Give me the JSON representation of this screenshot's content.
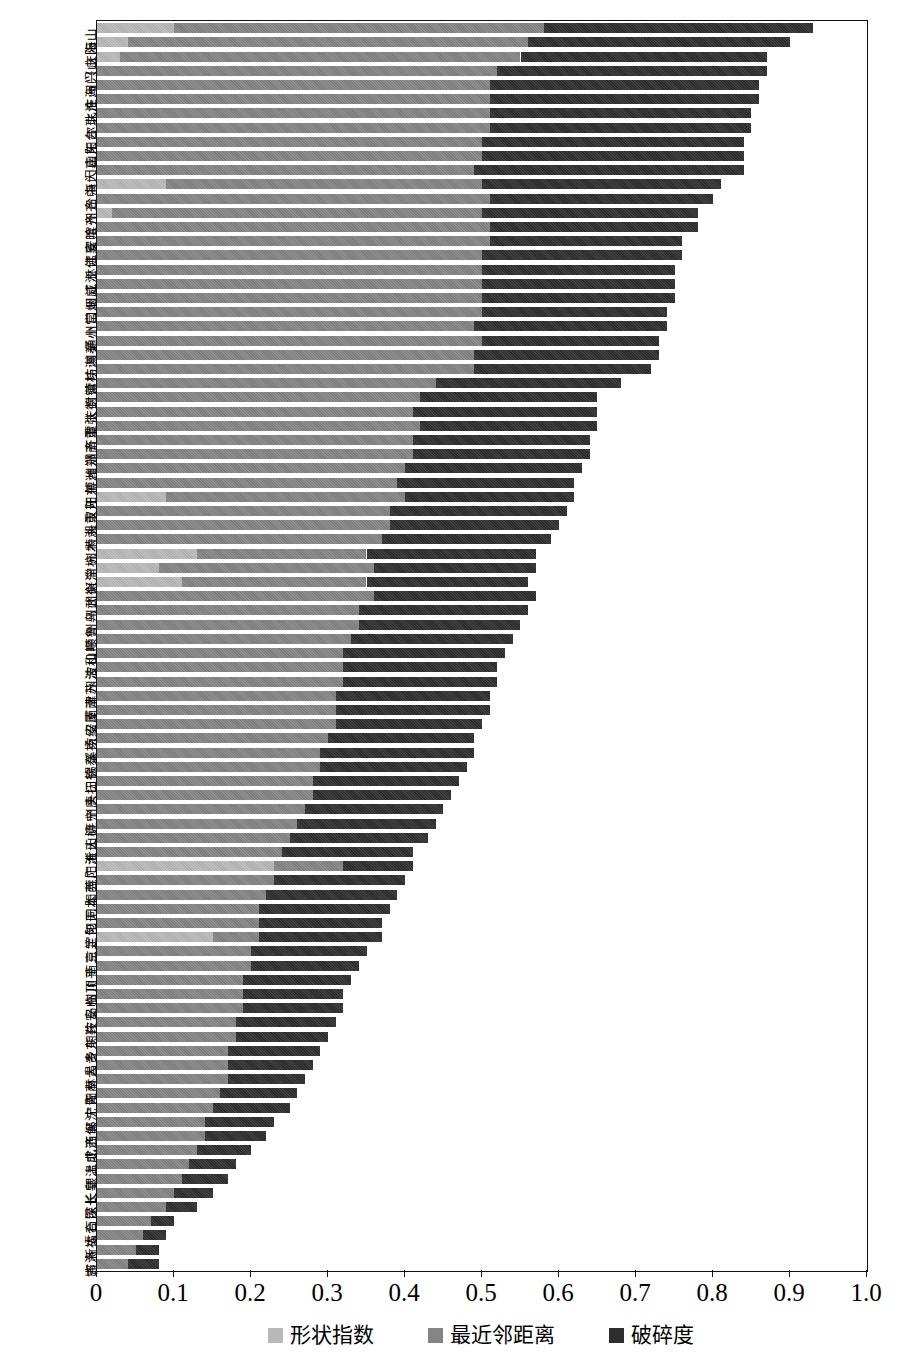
{
  "chart_data": {
    "type": "bar",
    "orientation": "horizontal",
    "stacked": true,
    "title": "",
    "xlabel": "",
    "ylabel": "",
    "xlim": [
      0,
      1.0
    ],
    "xticks": [
      "0",
      "0.1",
      "0.2",
      "0.3",
      "0.4",
      "0.5",
      "0.6",
      "0.7",
      "0.8",
      "0.9",
      "1.0"
    ],
    "grid": false,
    "legend_position": "bottom-center",
    "series": [
      {
        "name": "形状指数",
        "color": "#b9b9b9"
      },
      {
        "name": "最近邻距离",
        "color": "#848484"
      },
      {
        "name": "破碎度",
        "color": "#2e2e2e"
      }
    ],
    "categories": [
      "海山",
      "庆阳",
      "兴山",
      "州门",
      "庄海",
      "北淮",
      "尔珠",
      "阳台",
      "山东",
      "门嘉",
      "海大",
      "台中",
      "州齐",
      "滨齐",
      "安哈",
      "江襄",
      "林佛",
      "江江",
      "州威",
      "口烟",
      "州常",
      "通小",
      "州秦",
      "坊淇",
      "营桂",
      "封镇",
      "庆德",
      "潭张",
      "齐重",
      "洲南",
      "州郑",
      "博潍",
      "阳东",
      "汉开",
      "头重",
      "特湘",
      "州木",
      "宁杭",
      "兴淄",
      "州衡",
      "州武",
      "州乌",
      "顺鲁",
      "山呼",
      "波和",
      "州浩",
      "津苏",
      "南南",
      "安厦",
      "京绍",
      "溪扬",
      "锡泰",
      "口徐",
      "头抚",
      "州唐",
      "连宁",
      "山柳",
      "沂天",
      "阳淮",
      "莞广",
      "阳西",
      "同本",
      "阳无",
      "定包",
      "京兰",
      "南三",
      "川平",
      "州顶",
      "岛临",
      "庄安",
      "明鞍",
      "乡东",
      "昌贵",
      "林大",
      "阳南",
      "宁青",
      "郸沈",
      "西保",
      "北济",
      "上成",
      "银温",
      "长皇",
      "深长",
      "石昆",
      "太合",
      "新福",
      "吉洛",
      "邯"
    ],
    "bars": [
      {
        "label": "海山",
        "shape": 0.1,
        "nnd": 0.48,
        "frag": 0.35
      },
      {
        "label": "庆阳",
        "shape": 0.04,
        "nnd": 0.52,
        "frag": 0.34
      },
      {
        "label": "兴山",
        "shape": 0.03,
        "nnd": 0.52,
        "frag": 0.32
      },
      {
        "label": "州门",
        "shape": 0.0,
        "nnd": 0.52,
        "frag": 0.35
      },
      {
        "label": "庄海",
        "shape": 0.0,
        "nnd": 0.51,
        "frag": 0.35
      },
      {
        "label": "北淮",
        "shape": 0.0,
        "nnd": 0.51,
        "frag": 0.35
      },
      {
        "label": "尔珠",
        "shape": 0.0,
        "nnd": 0.51,
        "frag": 0.34
      },
      {
        "label": "阳台",
        "shape": 0.0,
        "nnd": 0.51,
        "frag": 0.34
      },
      {
        "label": "山东",
        "shape": 0.0,
        "nnd": 0.5,
        "frag": 0.34
      },
      {
        "label": "门嘉",
        "shape": 0.0,
        "nnd": 0.5,
        "frag": 0.34
      },
      {
        "label": "海大",
        "shape": 0.0,
        "nnd": 0.49,
        "frag": 0.35
      },
      {
        "label": "台中",
        "shape": 0.09,
        "nnd": 0.41,
        "frag": 0.31
      },
      {
        "label": "州齐",
        "shape": 0.0,
        "nnd": 0.51,
        "frag": 0.29
      },
      {
        "label": "滨齐",
        "shape": 0.02,
        "nnd": 0.48,
        "frag": 0.28
      },
      {
        "label": "安哈",
        "shape": 0.0,
        "nnd": 0.51,
        "frag": 0.27
      },
      {
        "label": "江襄",
        "shape": 0.0,
        "nnd": 0.51,
        "frag": 0.25
      },
      {
        "label": "林佛",
        "shape": 0.0,
        "nnd": 0.5,
        "frag": 0.26
      },
      {
        "label": "江江",
        "shape": 0.0,
        "nnd": 0.5,
        "frag": 0.25
      },
      {
        "label": "州威",
        "shape": 0.0,
        "nnd": 0.5,
        "frag": 0.25
      },
      {
        "label": "口烟",
        "shape": 0.0,
        "nnd": 0.5,
        "frag": 0.25
      },
      {
        "label": "州常",
        "shape": 0.0,
        "nnd": 0.5,
        "frag": 0.24
      },
      {
        "label": "通小",
        "shape": 0.0,
        "nnd": 0.49,
        "frag": 0.25
      },
      {
        "label": "州秦",
        "shape": 0.0,
        "nnd": 0.5,
        "frag": 0.23
      },
      {
        "label": "坊淇",
        "shape": 0.0,
        "nnd": 0.49,
        "frag": 0.24
      },
      {
        "label": "营桂",
        "shape": 0.0,
        "nnd": 0.49,
        "frag": 0.23
      },
      {
        "label": "封镇",
        "shape": 0.0,
        "nnd": 0.44,
        "frag": 0.24
      },
      {
        "label": "庆德",
        "shape": 0.0,
        "nnd": 0.42,
        "frag": 0.23
      },
      {
        "label": "潭张",
        "shape": 0.0,
        "nnd": 0.41,
        "frag": 0.24
      },
      {
        "label": "齐重",
        "shape": 0.0,
        "nnd": 0.42,
        "frag": 0.23
      },
      {
        "label": "洲南",
        "shape": 0.0,
        "nnd": 0.41,
        "frag": 0.23
      },
      {
        "label": "州郑",
        "shape": 0.0,
        "nnd": 0.41,
        "frag": 0.23
      },
      {
        "label": "博潍",
        "shape": 0.0,
        "nnd": 0.4,
        "frag": 0.23
      },
      {
        "label": "阳东",
        "shape": 0.0,
        "nnd": 0.39,
        "frag": 0.23
      },
      {
        "label": "汉开",
        "shape": 0.09,
        "nnd": 0.31,
        "frag": 0.22
      },
      {
        "label": "头重",
        "shape": 0.0,
        "nnd": 0.38,
        "frag": 0.23
      },
      {
        "label": "特湘",
        "shape": 0.0,
        "nnd": 0.38,
        "frag": 0.22
      },
      {
        "label": "州木",
        "shape": 0.0,
        "nnd": 0.37,
        "frag": 0.22
      },
      {
        "label": "宁杭",
        "shape": 0.13,
        "nnd": 0.22,
        "frag": 0.22
      },
      {
        "label": "兴淄",
        "shape": 0.08,
        "nnd": 0.28,
        "frag": 0.21
      },
      {
        "label": "州衡",
        "shape": 0.11,
        "nnd": 0.24,
        "frag": 0.21
      },
      {
        "label": "州武",
        "shape": 0.0,
        "nnd": 0.36,
        "frag": 0.21
      },
      {
        "label": "州乌",
        "shape": 0.0,
        "nnd": 0.34,
        "frag": 0.22
      },
      {
        "label": "顺鲁",
        "shape": 0.0,
        "nnd": 0.34,
        "frag": 0.21
      },
      {
        "label": "山呼",
        "shape": 0.0,
        "nnd": 0.33,
        "frag": 0.21
      },
      {
        "label": "波和",
        "shape": 0.0,
        "nnd": 0.32,
        "frag": 0.21
      },
      {
        "label": "州浩",
        "shape": 0.0,
        "nnd": 0.32,
        "frag": 0.2
      },
      {
        "label": "津苏",
        "shape": 0.0,
        "nnd": 0.32,
        "frag": 0.2
      },
      {
        "label": "南南",
        "shape": 0.0,
        "nnd": 0.31,
        "frag": 0.2
      },
      {
        "label": "安厦",
        "shape": 0.0,
        "nnd": 0.31,
        "frag": 0.2
      },
      {
        "label": "京绍",
        "shape": 0.0,
        "nnd": 0.31,
        "frag": 0.19
      },
      {
        "label": "溪扬",
        "shape": 0.0,
        "nnd": 0.3,
        "frag": 0.19
      },
      {
        "label": "锡泰",
        "shape": 0.0,
        "nnd": 0.29,
        "frag": 0.2
      },
      {
        "label": "口徐",
        "shape": 0.0,
        "nnd": 0.29,
        "frag": 0.19
      },
      {
        "label": "头抚",
        "shape": 0.0,
        "nnd": 0.28,
        "frag": 0.19
      },
      {
        "label": "州唐",
        "shape": 0.0,
        "nnd": 0.28,
        "frag": 0.18
      },
      {
        "label": "连宁",
        "shape": 0.0,
        "nnd": 0.27,
        "frag": 0.18
      },
      {
        "label": "山柳",
        "shape": 0.0,
        "nnd": 0.26,
        "frag": 0.18
      },
      {
        "label": "沂天",
        "shape": 0.0,
        "nnd": 0.25,
        "frag": 0.18
      },
      {
        "label": "阳淮",
        "shape": 0.0,
        "nnd": 0.24,
        "frag": 0.17
      },
      {
        "label": "莞广",
        "shape": 0.23,
        "nnd": 0.09,
        "frag": 0.09
      },
      {
        "label": "阳西",
        "shape": 0.0,
        "nnd": 0.23,
        "frag": 0.17
      },
      {
        "label": "同本",
        "shape": 0.0,
        "nnd": 0.22,
        "frag": 0.17
      },
      {
        "label": "阳无",
        "shape": 0.0,
        "nnd": 0.21,
        "frag": 0.17
      },
      {
        "label": "定包",
        "shape": 0.0,
        "nnd": 0.21,
        "frag": 0.16
      },
      {
        "label": "京兰",
        "shape": 0.15,
        "nnd": 0.06,
        "frag": 0.16
      },
      {
        "label": "南三",
        "shape": 0.0,
        "nnd": 0.2,
        "frag": 0.15
      },
      {
        "label": "川平",
        "shape": 0.0,
        "nnd": 0.2,
        "frag": 0.14
      },
      {
        "label": "州顶",
        "shape": 0.0,
        "nnd": 0.19,
        "frag": 0.14
      },
      {
        "label": "岛临",
        "shape": 0.0,
        "nnd": 0.19,
        "frag": 0.13
      },
      {
        "label": "庄安",
        "shape": 0.0,
        "nnd": 0.19,
        "frag": 0.13
      },
      {
        "label": "明鞍",
        "shape": 0.0,
        "nnd": 0.18,
        "frag": 0.13
      },
      {
        "label": "乡东",
        "shape": 0.0,
        "nnd": 0.18,
        "frag": 0.12
      },
      {
        "label": "昌贵",
        "shape": 0.0,
        "nnd": 0.17,
        "frag": 0.12
      },
      {
        "label": "林大",
        "shape": 0.0,
        "nnd": 0.17,
        "frag": 0.11
      },
      {
        "label": "阳南",
        "shape": 0.0,
        "nnd": 0.17,
        "frag": 0.1
      },
      {
        "label": "宁青",
        "shape": 0.0,
        "nnd": 0.16,
        "frag": 0.1
      },
      {
        "label": "郸沈",
        "shape": 0.0,
        "nnd": 0.15,
        "frag": 0.1
      },
      {
        "label": "西保",
        "shape": 0.0,
        "nnd": 0.14,
        "frag": 0.09
      },
      {
        "label": "北济",
        "shape": 0.0,
        "nnd": 0.14,
        "frag": 0.08
      },
      {
        "label": "上成",
        "shape": 0.0,
        "nnd": 0.13,
        "frag": 0.07
      },
      {
        "label": "银温",
        "shape": 0.0,
        "nnd": 0.12,
        "frag": 0.06
      },
      {
        "label": "长皇",
        "shape": 0.0,
        "nnd": 0.11,
        "frag": 0.06
      },
      {
        "label": "深长",
        "shape": 0.0,
        "nnd": 0.1,
        "frag": 0.05
      },
      {
        "label": "石昆",
        "shape": 0.0,
        "nnd": 0.09,
        "frag": 0.04
      },
      {
        "label": "太合",
        "shape": 0.0,
        "nnd": 0.07,
        "frag": 0.03
      },
      {
        "label": "新福",
        "shape": 0.0,
        "nnd": 0.06,
        "frag": 0.03
      },
      {
        "label": "吉洛",
        "shape": 0.0,
        "nnd": 0.05,
        "frag": 0.03
      },
      {
        "label": "邯",
        "shape": 0.0,
        "nnd": 0.04,
        "frag": 0.04
      }
    ],
    "ylabel_groups": [
      "山海",
      "庆阳",
      "兴山",
      "州门",
      "庄海",
      "北淮",
      "尔珠",
      "阳台",
      "山东",
      "门嘉",
      "海大",
      "台中",
      "州齐",
      "滨齐",
      "安哈",
      "江襄",
      "林佛",
      "江江",
      "州威",
      "口烟",
      "州常",
      "通小",
      "州秦",
      "坊淇",
      "营桂",
      "封镇",
      "庆德",
      "潭张",
      "齐重",
      "洲南"
    ]
  },
  "legend": {
    "items": [
      {
        "label": "形状指数",
        "color": "#b9b9b9",
        "swatch": "shape-index-swatch"
      },
      {
        "label": "最近邻距离",
        "color": "#848484",
        "swatch": "nearest-neighbor-distance-swatch"
      },
      {
        "label": "破碎度",
        "color": "#2e2e2e",
        "swatch": "fragmentation-swatch"
      }
    ]
  },
  "axis": {
    "x_ticks": [
      "0",
      "0.1",
      "0.2",
      "0.3",
      "0.4",
      "0.5",
      "0.6",
      "0.7",
      "0.8",
      "0.9",
      "1.0"
    ]
  }
}
